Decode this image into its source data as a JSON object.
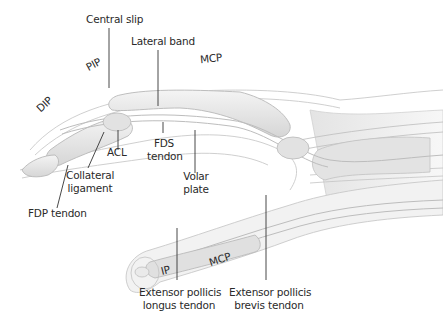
{
  "figure": {
    "colors": {
      "line": "#333333",
      "bone_fill": "#e8e8e8",
      "outline": "#c4c4c4",
      "background": "#ffffff"
    }
  },
  "labels": {
    "central_slip": "Central slip",
    "lateral_band": "Lateral band",
    "mcp_finger": "MCP",
    "pip": "PIP",
    "dip": "DIP",
    "acl": "ACL",
    "fds_tendon_1": "FDS",
    "fds_tendon_2": "tendon",
    "collateral_ligament_1": "Collateral",
    "collateral_ligament_2": "ligament",
    "volar_plate_1": "Volar",
    "volar_plate_2": "plate",
    "fdp_tendon": "FDP tendon",
    "mcp_thumb": "MCP",
    "ip": "IP",
    "epl_tendon_1": "Extensor pollicis",
    "epl_tendon_2": "longus tendon",
    "epb_tendon_1": "Extensor pollicis",
    "epb_tendon_2": "brevis tendon"
  }
}
